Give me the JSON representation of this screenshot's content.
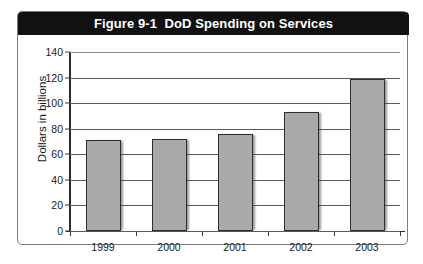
{
  "figure": {
    "title": "Figure 9-1  DoD Spending on Services",
    "frame_color": "#7d7d7d",
    "title_bar_color": "#111111",
    "title_text_color": "#ffffff"
  },
  "chart_data": {
    "type": "bar",
    "title": "Figure 9-1  DoD Spending on Services",
    "xlabel": "",
    "ylabel": "Dollars in billions",
    "categories": [
      "1999",
      "2000",
      "2001",
      "2002",
      "2003"
    ],
    "values": [
      71,
      72,
      76,
      93,
      119
    ],
    "ylim": [
      0,
      140
    ],
    "yticks": [
      0,
      20,
      40,
      60,
      80,
      100,
      120,
      140
    ],
    "ytick_labels": [
      "0",
      "20",
      "40",
      "60",
      "80",
      "100",
      "120",
      "140"
    ],
    "grid": true,
    "legend": null,
    "bar_color": "#a9a9a9",
    "bar_border_color": "#2e2e2e"
  }
}
